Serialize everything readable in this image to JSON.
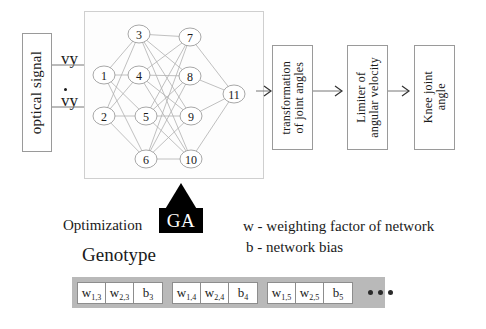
{
  "diagram": {
    "input_block": {
      "label": "optical signal"
    },
    "signals": [
      {
        "name": "position-signal",
        "label": "vy"
      },
      {
        "name": "velocity-signal",
        "label": "vy",
        "has_dot": true
      }
    ],
    "network": {
      "layers": [
        {
          "name": "input-layer",
          "nodes": [
            "1",
            "2"
          ]
        },
        {
          "name": "hidden-layer-1",
          "nodes": [
            "3",
            "4",
            "5",
            "6"
          ]
        },
        {
          "name": "hidden-layer-2",
          "nodes": [
            "7",
            "8",
            "9",
            "10"
          ]
        },
        {
          "name": "output-layer",
          "nodes": [
            "11"
          ]
        }
      ],
      "node_positions": [
        {
          "id": "1",
          "x": 19,
          "y": 63
        },
        {
          "id": "2",
          "x": 19,
          "y": 104
        },
        {
          "id": "3",
          "x": 54,
          "y": 22
        },
        {
          "id": "4",
          "x": 54,
          "y": 63
        },
        {
          "id": "5",
          "x": 61,
          "y": 104
        },
        {
          "id": "6",
          "x": 61,
          "y": 147
        },
        {
          "id": "7",
          "x": 105,
          "y": 25
        },
        {
          "id": "8",
          "x": 105,
          "y": 64
        },
        {
          "id": "9",
          "x": 106,
          "y": 104
        },
        {
          "id": "10",
          "x": 106,
          "y": 147
        },
        {
          "id": "11",
          "x": 149,
          "y": 82
        }
      ],
      "edges": [
        [
          "1",
          "3"
        ],
        [
          "1",
          "4"
        ],
        [
          "1",
          "5"
        ],
        [
          "1",
          "6"
        ],
        [
          "2",
          "3"
        ],
        [
          "2",
          "4"
        ],
        [
          "2",
          "5"
        ],
        [
          "2",
          "6"
        ],
        [
          "3",
          "7"
        ],
        [
          "3",
          "8"
        ],
        [
          "3",
          "9"
        ],
        [
          "3",
          "10"
        ],
        [
          "4",
          "7"
        ],
        [
          "4",
          "8"
        ],
        [
          "4",
          "9"
        ],
        [
          "4",
          "10"
        ],
        [
          "5",
          "7"
        ],
        [
          "5",
          "8"
        ],
        [
          "5",
          "9"
        ],
        [
          "5",
          "10"
        ],
        [
          "6",
          "7"
        ],
        [
          "6",
          "8"
        ],
        [
          "6",
          "9"
        ],
        [
          "6",
          "10"
        ],
        [
          "7",
          "11"
        ],
        [
          "8",
          "11"
        ],
        [
          "9",
          "11"
        ],
        [
          "10",
          "11"
        ]
      ]
    },
    "pipeline_blocks": [
      {
        "name": "transformation-block",
        "label": "transformation\nof joint angles"
      },
      {
        "name": "limiter-block",
        "label": "Limiter of\nangular velocity"
      },
      {
        "name": "output-block",
        "label": "Knee joint\nangle"
      }
    ],
    "optimization": {
      "label": "Optimization",
      "ga_label": "GA",
      "genotype_label": "Genotype"
    },
    "legend": [
      {
        "name": "legend-weight",
        "text": "w - weighting  factor of network"
      },
      {
        "name": "legend-bias",
        "text": "b - network bias"
      }
    ],
    "genotype_strip": {
      "groups": [
        {
          "cells": [
            {
              "symbol": "w",
              "sub": "1,3"
            },
            {
              "symbol": "w",
              "sub": "2,3"
            },
            {
              "symbol": "b",
              "sub": "3"
            }
          ]
        },
        {
          "cells": [
            {
              "symbol": "w",
              "sub": "1,4"
            },
            {
              "symbol": "w",
              "sub": "2,4"
            },
            {
              "symbol": "b",
              "sub": "4"
            }
          ]
        },
        {
          "cells": [
            {
              "symbol": "w",
              "sub": "1,5"
            },
            {
              "symbol": "w",
              "sub": "2,5"
            },
            {
              "symbol": "b",
              "sub": "5"
            }
          ]
        }
      ],
      "continuation": "•••"
    }
  }
}
